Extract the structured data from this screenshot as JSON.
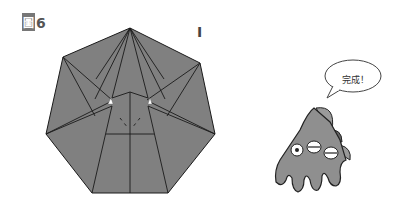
{
  "figure": {
    "label_prefix": "圖",
    "label_number": "6",
    "step_mark": "I"
  },
  "diagram": {
    "shape": "heptagon-origami-model",
    "fill_color": "#808080",
    "line_color": "#1a1a1a"
  },
  "character": {
    "speech": "完成！",
    "body_color": "#8f8f8f"
  }
}
